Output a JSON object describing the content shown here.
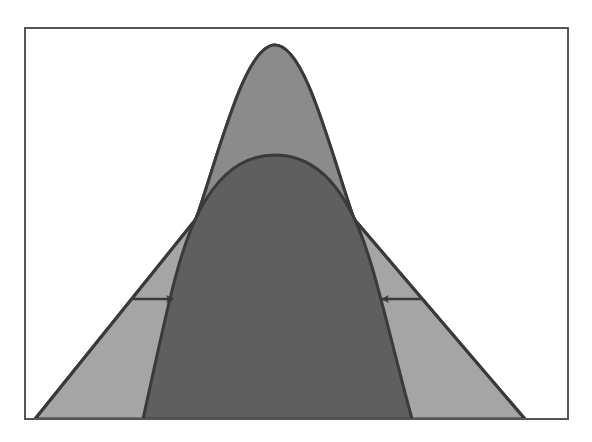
{
  "diagram": {
    "type": "overlapping-distribution-shapes",
    "frame": {
      "x": 25,
      "y": 28,
      "width": 543,
      "height": 391
    },
    "colors": {
      "background": "#ffffff",
      "frame_stroke": "#555555",
      "outer_fill_lower": "#a3a3a3",
      "outer_fill_upper": "#8a8a8a",
      "inner_fill": "#5f5f5f",
      "stroke": "#3a3a3a"
    },
    "shapes": [
      {
        "name": "outer-peaked-curve",
        "peak": [
          275,
          45
        ],
        "base_left": 35,
        "base_right": 525,
        "baseline_y": 419
      },
      {
        "name": "inner-dome",
        "peak": [
          275,
          155
        ],
        "base_left": 143,
        "base_right": 412,
        "baseline_y": 419
      }
    ],
    "arrows": [
      {
        "name": "left-arrow",
        "from": [
          133,
          299
        ],
        "to": [
          173,
          299
        ],
        "direction": "right"
      },
      {
        "name": "right-arrow",
        "from": [
          422,
          299
        ],
        "to": [
          382,
          299
        ],
        "direction": "left"
      }
    ]
  }
}
